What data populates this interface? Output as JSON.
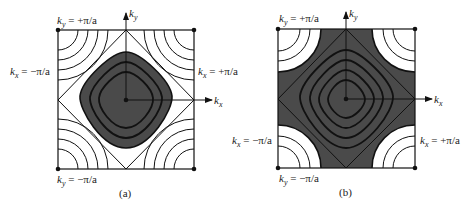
{
  "figure": {
    "panels": [
      {
        "id": "a",
        "caption": "(a)",
        "labels": {
          "ky_top": "k_y = +π/a",
          "ky_bottom": "k_y = −π/a",
          "kx_left": "k_x = −π/a",
          "kx_right": "k_x = +π/a",
          "axis_x": "k_x",
          "axis_y": "k_y"
        },
        "description": "Constant-energy contours in first Brillouin zone; filled (dark) region inside the diamond-shaped Fermi surface centered at origin"
      },
      {
        "id": "b",
        "caption": "(b)",
        "labels": {
          "ky_top": "k_y = +π/a",
          "ky_bottom": "k_y = −π/a",
          "kx_left": "k_x = −π/a",
          "kx_right": "k_x = +π/a",
          "axis_x": "k_x",
          "axis_y": "k_y"
        },
        "description": "Same contours with band nearly filled; dark region extends to corners leaving white pockets at the four zone corners"
      }
    ],
    "text": {
      "ky_pre": "k",
      "y_sub": "y",
      "x_sub": "x",
      "plus_pi_a": " = +π/a",
      "minus_pi_a": " = −π/a",
      "caption_a": "(a)",
      "caption_b": "(b)"
    },
    "colors": {
      "fill_dark": "#4a4a4a",
      "line": "#111111",
      "background": "#ffffff"
    }
  }
}
